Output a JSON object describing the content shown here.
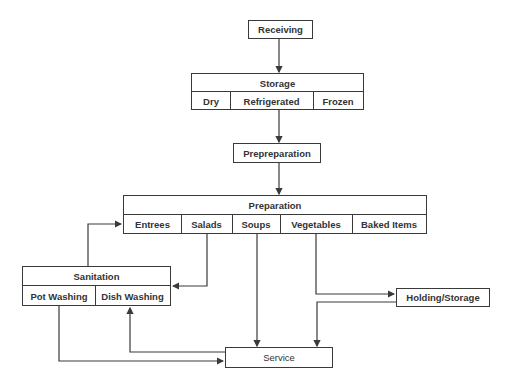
{
  "diagram": {
    "type": "food-service flow diagram",
    "nodes": {
      "receiving": {
        "label": "Receiving"
      },
      "storage": {
        "label": "Storage",
        "sub": [
          "Dry",
          "Refrigerated",
          "Frozen"
        ]
      },
      "prepreparation": {
        "label": "Prepreparation"
      },
      "preparation": {
        "label": "Preparation",
        "sub": [
          "Entrees",
          "Salads",
          "Soups",
          "Vegetables",
          "Baked Items"
        ]
      },
      "sanitation": {
        "label": "Sanitation",
        "sub": [
          "Pot Washing",
          "Dish Washing"
        ]
      },
      "holding": {
        "label": "Holding/Storage"
      },
      "service": {
        "label": "Service"
      }
    },
    "edges": [
      {
        "from": "Receiving",
        "to": "Storage"
      },
      {
        "from": "Storage",
        "to": "Prepreparation"
      },
      {
        "from": "Prepreparation",
        "to": "Preparation"
      },
      {
        "from": "Salads",
        "to": "Sanitation"
      },
      {
        "from": "Sanitation",
        "to": "Entrees"
      },
      {
        "from": "Soups",
        "to": "Service"
      },
      {
        "from": "Vegetables",
        "to": "Holding/Storage"
      },
      {
        "from": "Holding/Storage",
        "to": "Service"
      },
      {
        "from": "Service",
        "to": "Dish Washing"
      },
      {
        "from": "Pot Washing",
        "to": "Service"
      }
    ]
  }
}
